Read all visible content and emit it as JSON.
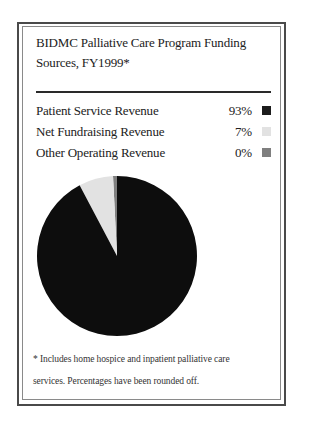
{
  "title": {
    "line1": "BIDMC Palliative Care Program Funding",
    "line2": "Sources, FY1999*"
  },
  "legend": {
    "items": [
      {
        "label": "Patient Service Revenue",
        "value": "93%",
        "color": "#1c1c1c"
      },
      {
        "label": "Net Fundraising Revenue",
        "value": "7%",
        "color": "#e2e2e2"
      },
      {
        "label": "Other Operating Revenue",
        "value": "0%",
        "color": "#7f7f7f"
      }
    ]
  },
  "footnote": {
    "line1": "* Includes home hospice and inpatient palliative care",
    "line2": "services. Percentages have been rounded off."
  },
  "chart_data": {
    "type": "pie",
    "title": "BIDMC Palliative Care Program Funding Sources, FY1999*",
    "categories": [
      "Patient Service Revenue",
      "Net Fundraising Revenue",
      "Other Operating Revenue"
    ],
    "values": [
      93,
      7,
      0
    ],
    "unit": "%",
    "colors": [
      "#0d0d0d",
      "#e2e2e2",
      "#7f7f7f"
    ],
    "legend_position": "top",
    "start_angle": "12 o'clock, counter-clockwise order: Other Operating (thin sliver), Net Fundraising, Patient Service",
    "annotations": [
      "* Includes home hospice and inpatient palliative care services. Percentages have been rounded off."
    ]
  }
}
